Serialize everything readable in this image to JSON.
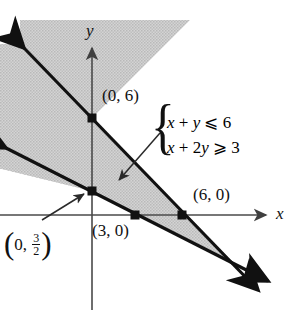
{
  "figure": {
    "type": "inequality-region-graph",
    "axes": {
      "x_axis_label": "x",
      "y_axis_label": "y",
      "origin_px": [
        92,
        215
      ],
      "units_per_px": 15.6
    },
    "system": {
      "inequality_1": "x + y ⩽ 6",
      "inequality_2": "x + 2y ⩾ 3",
      "brace": "{"
    },
    "point_labels": [
      {
        "id": "y-intercept-line1",
        "text": "(0, 6)",
        "point": [
          0,
          6
        ]
      },
      {
        "id": "x-intercept-line1",
        "text": "(6, 0)",
        "point": [
          6,
          0
        ]
      },
      {
        "id": "x-intercept-line2",
        "text": "(3, 0)",
        "point": [
          3,
          0
        ]
      },
      {
        "id": "y-intercept-line2",
        "text_open": "(0,",
        "text_num": "3",
        "text_den": "2",
        "text_close": ")",
        "point": [
          0,
          1.5
        ]
      }
    ],
    "colors": {
      "line": "#111111",
      "axis": "#4a4a4a",
      "shading": "#c9c9c9",
      "background": "#ffffff"
    }
  },
  "chart_data": {
    "type": "line",
    "title": "",
    "xlabel": "x",
    "ylabel": "y",
    "xlim": [
      -6,
      13
    ],
    "ylim": [
      -7,
      10
    ],
    "grid": false,
    "legend": "none",
    "series": [
      {
        "name": "x + y = 6",
        "equation": "x + y = 6",
        "slope": -1,
        "intercept": 6,
        "points": [
          [
            0,
            6
          ],
          [
            6,
            0
          ]
        ],
        "arrows_both_ends": true
      },
      {
        "name": "x + 2y = 3",
        "equation": "x + 2y = 3",
        "slope": -0.5,
        "intercept": 1.5,
        "points": [
          [
            0,
            1.5
          ],
          [
            3,
            0
          ]
        ],
        "arrows_both_ends": true
      }
    ],
    "marked_points": [
      {
        "label": "(0, 6)",
        "x": 0,
        "y": 6
      },
      {
        "label": "(6, 0)",
        "x": 6,
        "y": 0
      },
      {
        "label": "(3, 0)",
        "x": 3,
        "y": 0
      },
      {
        "label": "(0, 3/2)",
        "x": 0,
        "y": 1.5
      }
    ],
    "shaded_region": {
      "description": "Region satisfying x + y ⩽ 6 and x + 2y ⩾ 3",
      "constraints": [
        "x + y ⩽ 6",
        "x + 2y ⩾ 3"
      ],
      "vertex": [
        9,
        -3
      ],
      "fill": "#c9c9c9"
    },
    "annotations": [
      {
        "text": "x + y ⩽ 6",
        "points_to_region": true
      },
      {
        "text": "x + 2y ⩾ 3",
        "points_to_region": true
      }
    ]
  }
}
